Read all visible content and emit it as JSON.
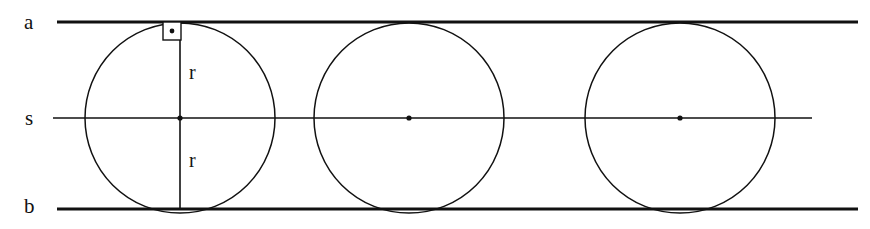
{
  "figure": {
    "background_color": "#ffffff",
    "stroke_color": "#111111",
    "width": 870,
    "height": 229,
    "labels": {
      "line_a": "a",
      "line_s": "s",
      "line_b": "b",
      "radius_upper": "r",
      "radius_lower": "r"
    },
    "lines": [
      {
        "name": "a",
        "role": "upper-parallel-tangent-line",
        "x1": 57,
        "y1": 22,
        "x2": 858,
        "y2": 22,
        "stroke_width": 3
      },
      {
        "name": "s",
        "role": "midline-through-centers",
        "x1": 53,
        "y1": 118,
        "x2": 812,
        "y2": 118,
        "stroke_width": 1.6
      },
      {
        "name": "b",
        "role": "lower-parallel-tangent-line",
        "x1": 57,
        "y1": 209,
        "x2": 858,
        "y2": 209,
        "stroke_width": 3
      }
    ],
    "circles": [
      {
        "name": "circle-1",
        "cx": 180,
        "cy": 118,
        "r": 95,
        "stroke_width": 1.5,
        "center_dot": true
      },
      {
        "name": "circle-2",
        "cx": 409,
        "cy": 118,
        "r": 95,
        "stroke_width": 1.5,
        "center_dot": true
      },
      {
        "name": "circle-3",
        "cx": 680,
        "cy": 118,
        "r": 95,
        "stroke_width": 1.5,
        "center_dot": true
      }
    ],
    "diameter_segment": {
      "name": "vertical-diameter-circle-1",
      "x": 180,
      "y1": 23,
      "y2": 208,
      "stroke_width": 1.6
    },
    "right_angle_marker": {
      "name": "right-angle-square",
      "x": 163,
      "y": 22,
      "size": 18,
      "stroke_width": 1.4,
      "dot_radius": 2.4,
      "description": "square with centre dot at tangency point of circle 1 and line a"
    },
    "center_dot_radius": 2.6
  }
}
